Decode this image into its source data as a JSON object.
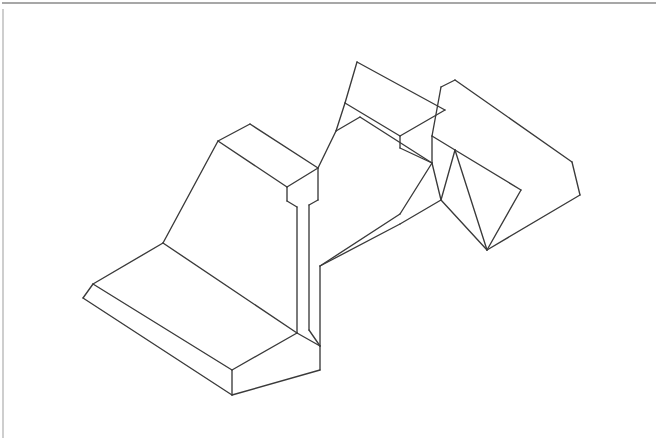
{
  "document": {
    "title": "Isometric Technical Drawing",
    "subject": "Machined bracket part — twin wedge ribs on a stepped base",
    "projection": "Isometric",
    "line_style": "Visible edges only (no hidden lines)",
    "background_color": "#ffffff",
    "edge_color": "#3a3a3a",
    "frame_color": "#8a8a8a",
    "face_color": "#ffffff",
    "canvas": {
      "width": 659,
      "height": 440
    }
  },
  "frame": {
    "top_rule": {
      "x1": 2,
      "y1": 3,
      "x2": 656,
      "y2": 3
    },
    "left_rule": {
      "x1": 3,
      "y1": 9,
      "x2": 3,
      "y2": 438
    }
  },
  "geometry": {
    "faces": [
      {
        "name": "base-top-face",
        "points": "93,284 163,243 232,288 297,333 232,370 162,327"
      },
      {
        "name": "base-front-left-face",
        "points": "83,298 93,284 162,327 232,370 232,395 160,350"
      },
      {
        "name": "base-front-right-face",
        "points": "232,370 297,333 320,346 320,370 232,395"
      },
      {
        "name": "left-rib-top-face",
        "points": "218,141 250,124 318,168 287,187"
      },
      {
        "name": "left-rib-left-face",
        "points": "163,243 218,141 287,187 287,201 297,207 297,333 232,288"
      },
      {
        "name": "left-rib-right-face",
        "points": "287,187 318,168 318,200 309,205 309,330 297,333 297,207 287,201"
      },
      {
        "name": "upper-deck-face",
        "points": "318,168 336,131 360,117 432,163 455,150 484,166 440,191 400,214 330,172"
      },
      {
        "name": "top-rib-top-face",
        "points": "357,62 410,89 445,110 400,136 345,103"
      },
      {
        "name": "top-rib-front-face",
        "points": "345,103 400,136 400,148 432,163 360,117 336,131"
      },
      {
        "name": "right-rib-top-face",
        "points": "441,87 455,80 530,124 572,162 521,190 455,150 432,136"
      },
      {
        "name": "right-rib-left-face",
        "points": "432,136 455,150 487,250 441,200 432,163"
      },
      {
        "name": "right-rib-front-face",
        "points": "455,150 521,190 580,195 572,200 487,250"
      },
      {
        "name": "right-rib-end-face",
        "points": "572,162 580,195 521,190"
      },
      {
        "name": "mid-web-face",
        "points": "320,346 320,266 400,214 440,191 487,250 441,200 400,224"
      }
    ],
    "edges": [
      {
        "name": "base-top-left-back-edge",
        "d": "M 93,284 L 163,243"
      },
      {
        "name": "base-top-back-edge",
        "d": "M 163,243 L 297,333"
      },
      {
        "name": "base-top-right-edge",
        "d": "M 297,333 L 232,370"
      },
      {
        "name": "base-top-front-edge",
        "d": "M 232,370 L 93,284"
      },
      {
        "name": "base-left-bevel-edge",
        "d": "M 93,284 L 83,298"
      },
      {
        "name": "base-bottom-front-left-edge",
        "d": "M 83,298 L 232,395"
      },
      {
        "name": "base-front-corner-edge",
        "d": "M 232,370 L 232,395"
      },
      {
        "name": "base-bottom-front-right-edge",
        "d": "M 232,395 L 320,370"
      },
      {
        "name": "base-right-vertical-edge",
        "d": "M 320,346 L 320,370"
      },
      {
        "name": "base-right-top-edge",
        "d": "M 297,333 L 320,346"
      },
      {
        "name": "left-rib-top-back-edge",
        "d": "M 218,141 L 250,124"
      },
      {
        "name": "left-rib-top-right-edge",
        "d": "M 250,124 L 318,168"
      },
      {
        "name": "left-rib-top-front-edge",
        "d": "M 318,168 L 287,187"
      },
      {
        "name": "left-rib-top-left-edge",
        "d": "M 287,187 L 218,141"
      },
      {
        "name": "left-rib-slope-edge",
        "d": "M 218,141 L 163,243"
      },
      {
        "name": "left-rib-left-vertical-edge",
        "d": "M 287,187 L 287,201"
      },
      {
        "name": "left-rib-inner-step-edge",
        "d": "M 287,201 L 297,207"
      },
      {
        "name": "left-rib-inner-vertical-edge",
        "d": "M 297,207 L 297,333"
      },
      {
        "name": "left-rib-right-vertical-edge",
        "d": "M 318,168 L 318,200"
      },
      {
        "name": "left-rib-notch-diag-edge",
        "d": "M 318,200 L 309,205"
      },
      {
        "name": "left-rib-outer-vertical-edge",
        "d": "M 309,205 L 309,330"
      },
      {
        "name": "left-rib-foot-edge",
        "d": "M 309,330 L 320,346"
      },
      {
        "name": "deck-left-rise-edge",
        "d": "M 318,168 L 336,131"
      },
      {
        "name": "deck-left-top-edge",
        "d": "M 336,131 L 360,117"
      },
      {
        "name": "top-rib-left-slope-edge",
        "d": "M 345,103 L 357,62"
      },
      {
        "name": "top-rib-top-back-edge",
        "d": "M 357,62 L 445,110"
      },
      {
        "name": "top-rib-top-left-edge",
        "d": "M 345,103 L 400,136"
      },
      {
        "name": "top-rib-top-front-edge",
        "d": "M 400,136 L 445,110"
      },
      {
        "name": "top-rib-front-vertical-edge",
        "d": "M 400,136 L 400,148"
      },
      {
        "name": "top-rib-front-slope-edge",
        "d": "M 400,148 L 432,163"
      },
      {
        "name": "top-rib-front-left-edge",
        "d": "M 336,131 L 345,103"
      },
      {
        "name": "deck-back-edge",
        "d": "M 360,117 L 432,163"
      },
      {
        "name": "deck-valley-left-edge",
        "d": "M 432,163 L 400,214"
      },
      {
        "name": "deck-valley-right-edge",
        "d": "M 400,214 L 320,266"
      },
      {
        "name": "mid-web-left-vertical-edge",
        "d": "M 320,266 L 320,346"
      },
      {
        "name": "mid-web-under-edge",
        "d": "M 400,224 L 441,200"
      },
      {
        "name": "mid-web-front-edge",
        "d": "M 320,266 L 400,224"
      },
      {
        "name": "mid-web-lower-edge",
        "d": "M 441,200 L 487,250"
      },
      {
        "name": "right-rib-left-slope-edge",
        "d": "M 432,136 L 441,87"
      },
      {
        "name": "right-rib-top-back-edge",
        "d": "M 441,87 L 455,80"
      },
      {
        "name": "right-rib-top-back-long-edge",
        "d": "M 455,80 L 572,162"
      },
      {
        "name": "right-rib-top-left-edge",
        "d": "M 432,136 L 455,150"
      },
      {
        "name": "right-rib-top-front-edge",
        "d": "M 455,150 L 521,190"
      },
      {
        "name": "right-rib-end-vertical-edge",
        "d": "M 572,162 L 580,195"
      },
      {
        "name": "right-rib-end-front-edge",
        "d": "M 580,195 L 487,250"
      },
      {
        "name": "right-rib-front-valley-edge",
        "d": "M 521,190 L 487,250"
      },
      {
        "name": "right-rib-left-face-edge",
        "d": "M 432,136 L 432,163"
      },
      {
        "name": "right-rib-inner-slope-edge",
        "d": "M 455,150 L 487,250"
      },
      {
        "name": "deck-notch-left-edge",
        "d": "M 432,163 L 441,200"
      },
      {
        "name": "deck-notch-right-edge",
        "d": "M 441,200 L 455,150"
      }
    ]
  },
  "labels": {
    "no_text_present": "This drawing contains no visible text, dimensions, or annotations."
  }
}
